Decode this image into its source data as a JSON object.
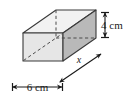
{
  "figure": {
    "type": "rectangular-prism-diagram",
    "projection": "oblique",
    "background_color": "#ffffff",
    "colors": {
      "outline": "#3a3a3a",
      "hidden_edge": "#4a4a4a",
      "face_left": "#e4e4e4",
      "face_front": "#b9b9b9",
      "face_top": "#f2f2f2",
      "label_text": "#1a1a1a"
    },
    "labels": {
      "height": "4 cm",
      "width": "6 cm",
      "length": "x"
    },
    "dimensions": [
      {
        "name": "height",
        "value": "4 cm",
        "position": "right",
        "arrow": "double-vertical"
      },
      {
        "name": "width",
        "value": "6 cm",
        "position": "bottom-left",
        "arrow": "double-horizontal"
      },
      {
        "name": "length",
        "value": "x",
        "position": "bottom-right-diagonal",
        "arrow": "double-diagonal"
      }
    ]
  }
}
